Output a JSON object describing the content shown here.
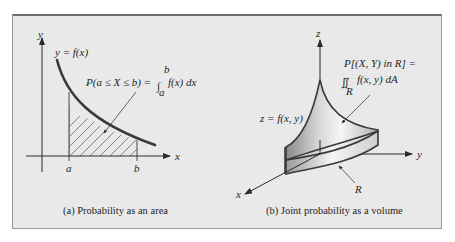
{
  "panel_a": {
    "caption": "(a) Probability as an area",
    "axis_x": "x",
    "axis_y": "y",
    "curve_label": "y = f(x)",
    "annotation_lhs": "P(a ≤ X ≤ b) =",
    "annotation_integral": "∫",
    "annotation_upper": "b",
    "annotation_lower": "a",
    "annotation_rhs": "f(x) dx",
    "tick_a": "a",
    "tick_b": "b"
  },
  "panel_b": {
    "caption": "(b) Joint probability as a volume",
    "axis_x": "x",
    "axis_y": "y",
    "axis_z": "z",
    "surface_label": "z = f(x, y)",
    "annotation_line1": "P[(X, Y) in R] =",
    "annotation_integral": "∬",
    "annotation_region_sub": "R",
    "annotation_rhs": "f(x, y) dA",
    "region_label": "R"
  },
  "colors": {
    "background": "#e9e9e9",
    "curve": "#3a3a3a",
    "axis": "#2a2a2a",
    "surface_light": "#f2f2f2",
    "surface_dark": "#8e8e8e"
  }
}
